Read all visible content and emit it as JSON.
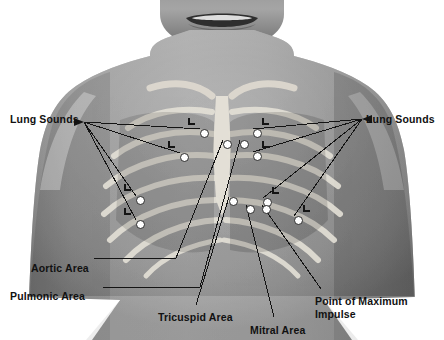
{
  "image": {
    "title": "Chest auscultation landmarks",
    "subject": "anterior chest with rib cage overlay",
    "background_color": "#ffffff",
    "skin_tone": "#8e8e8e",
    "bone_color": "#e8e8e4",
    "marker_color": "#ffffff",
    "line_color": "#1a1a1a",
    "text_color": "#111111"
  },
  "labels": [
    {
      "id": "lung-sounds-left",
      "text": "Lung Sounds",
      "x": 10,
      "y": 113
    },
    {
      "id": "lung-sounds-right",
      "text": "Lung Sounds",
      "x": 366,
      "y": 113
    },
    {
      "id": "aortic-area",
      "text": "Aortic Area",
      "x": 31,
      "y": 262
    },
    {
      "id": "pulmonic-area",
      "text": "Pulmonic Area",
      "x": 10,
      "y": 290
    },
    {
      "id": "tricuspid-area",
      "text": "Tricuspid Area",
      "x": 158,
      "y": 311
    },
    {
      "id": "mitral-area",
      "text": "Mitral Area",
      "x": 250,
      "y": 324
    },
    {
      "id": "pmi-line1",
      "text": "Point of Maximum",
      "x": 315,
      "y": 295
    },
    {
      "id": "pmi-line2",
      "text": "Impulse",
      "x": 315,
      "y": 308
    }
  ],
  "markers": [
    {
      "id": "lung-left-upper",
      "x": 200,
      "y": 129,
      "region": "lung",
      "side": "left"
    },
    {
      "id": "lung-left-mid",
      "x": 180,
      "y": 153,
      "region": "lung",
      "side": "left"
    },
    {
      "id": "lung-left-lower",
      "x": 136,
      "y": 196,
      "region": "lung",
      "side": "left"
    },
    {
      "id": "lung-left-lowest",
      "x": 136,
      "y": 220,
      "region": "lung",
      "side": "left"
    },
    {
      "id": "lung-right-upper",
      "x": 253,
      "y": 129,
      "region": "lung",
      "side": "right"
    },
    {
      "id": "lung-right-mid",
      "x": 253,
      "y": 152,
      "region": "lung",
      "side": "right"
    },
    {
      "id": "lung-right-lower",
      "x": 263,
      "y": 198,
      "region": "lung",
      "side": "right"
    },
    {
      "id": "lung-right-lowest",
      "x": 294,
      "y": 216,
      "region": "lung",
      "side": "right"
    },
    {
      "id": "aortic-point",
      "x": 223,
      "y": 140,
      "region": "heart"
    },
    {
      "id": "pulmonic-point",
      "x": 240,
      "y": 140,
      "region": "heart"
    },
    {
      "id": "tricuspid-point",
      "x": 229,
      "y": 197,
      "region": "heart"
    },
    {
      "id": "mitral-point",
      "x": 246,
      "y": 205,
      "region": "heart"
    },
    {
      "id": "pmi-point",
      "x": 262,
      "y": 205,
      "region": "heart"
    }
  ],
  "l_brackets": [
    {
      "id": "l-left-upper",
      "x": 188,
      "y": 118
    },
    {
      "id": "l-left-mid",
      "x": 168,
      "y": 141
    },
    {
      "id": "l-left-lower",
      "x": 124,
      "y": 184
    },
    {
      "id": "l-left-lowest",
      "x": 124,
      "y": 208
    },
    {
      "id": "l-right-upper",
      "x": 262,
      "y": 118
    },
    {
      "id": "l-right-mid",
      "x": 262,
      "y": 141
    },
    {
      "id": "l-right-lower",
      "x": 272,
      "y": 187
    },
    {
      "id": "l-right-lowest",
      "x": 303,
      "y": 205
    }
  ],
  "leader_lines": {
    "lung_left_anchor": {
      "x": 84,
      "y": 122
    },
    "lung_right_anchor": {
      "x": 362,
      "y": 119
    },
    "aortic_anchor": {
      "x": 94,
      "y": 258
    },
    "pulmonic_anchor": {
      "x": 103,
      "y": 287
    },
    "tricuspid_anchor": {
      "x": 196,
      "y": 305
    },
    "mitral_anchor": {
      "x": 274,
      "y": 317
    },
    "pmi_anchor": {
      "x": 321,
      "y": 289
    }
  }
}
